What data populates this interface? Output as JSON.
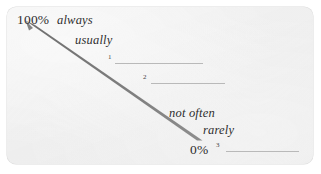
{
  "diagram": {
    "card": {
      "background_color": "#eeeeee",
      "border_radius": "9px"
    },
    "arrow": {
      "name": "probability-scale-arrow",
      "color": "#7a7a7a",
      "direction": "top-left to bottom-right",
      "shape": "tapered wedge",
      "start_label": "100%",
      "end_label": "0%"
    },
    "scale": {
      "top_value": "100%",
      "bottom_value": "0%"
    },
    "phrases": [
      {
        "text": "always",
        "position": "top"
      },
      {
        "text": "usually",
        "position": "upper-middle"
      },
      {
        "text": "not often",
        "position": "lower-middle"
      },
      {
        "text": "rarely",
        "position": "bottom"
      }
    ],
    "blanks": [
      {
        "number": "1"
      },
      {
        "number": "2"
      },
      {
        "number": "3"
      }
    ]
  }
}
